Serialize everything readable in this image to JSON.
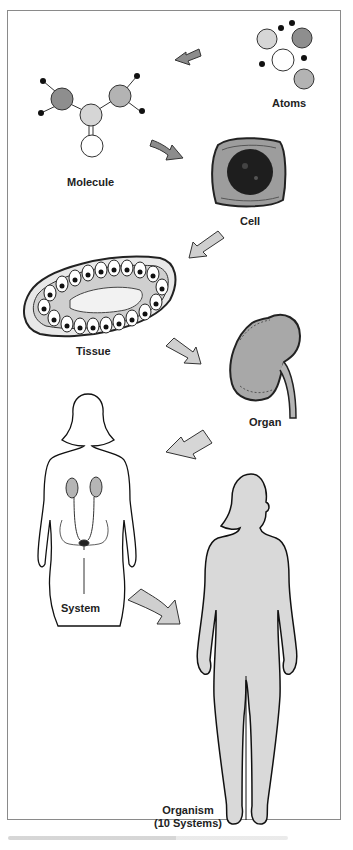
{
  "figure": {
    "stages": [
      {
        "id": "atoms",
        "label": "Atoms"
      },
      {
        "id": "molecule",
        "label": "Molecule"
      },
      {
        "id": "cell",
        "label": "Cell"
      },
      {
        "id": "tissue",
        "label": "Tissue"
      },
      {
        "id": "organ",
        "label": "Organ"
      },
      {
        "id": "system",
        "label": "System"
      },
      {
        "id": "organism",
        "label": "Organism",
        "sublabel": "(10 Systems)"
      }
    ],
    "colors": {
      "arrow_dark": "#8c8c8c",
      "arrow_light": "#cfcfcf",
      "atom_light": "#d6d6d6",
      "atom_dark": "#8e8e8e",
      "atom_mid": "#b3b3b3",
      "organ_fill": "#a8a8a8",
      "body_fill": "#d9d9d9",
      "frame": "#8a8a8a"
    }
  }
}
